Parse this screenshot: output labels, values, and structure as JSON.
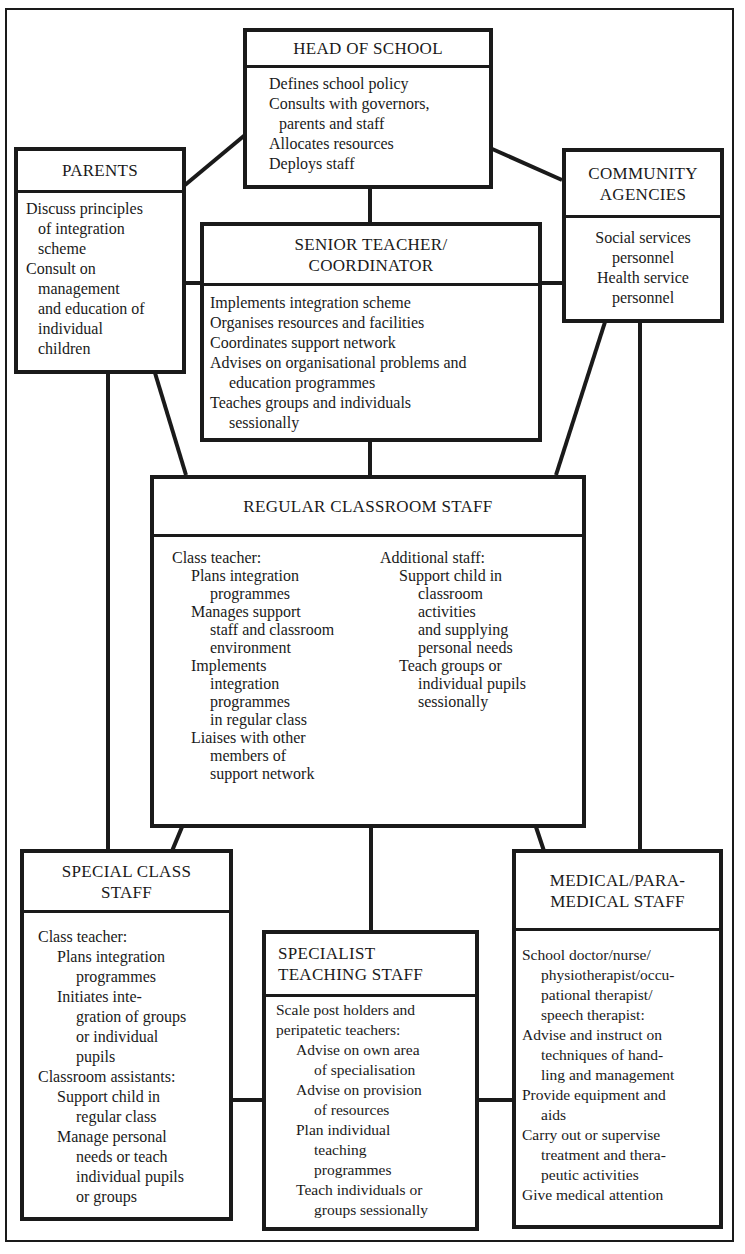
{
  "diagram": {
    "type": "organisational support network",
    "line_color": "#1a1a1a",
    "background": "#ffffff"
  },
  "head": {
    "title": "HEAD OF SCHOOL",
    "lines": [
      {
        "text": "Defines school policy",
        "indent": 0
      },
      {
        "text": "Consults with governors,",
        "indent": 0
      },
      {
        "text": "parents and staff",
        "indent": 1
      },
      {
        "text": "Allocates resources",
        "indent": 0
      },
      {
        "text": "Deploys staff",
        "indent": 0
      }
    ]
  },
  "parents": {
    "title": "PARENTS",
    "lines": [
      {
        "text": "Discuss principles",
        "indent": 0
      },
      {
        "text": "of integration",
        "indent": 1
      },
      {
        "text": "scheme",
        "indent": 1
      },
      {
        "text": "Consult on",
        "indent": 0
      },
      {
        "text": "management",
        "indent": 1
      },
      {
        "text": "and education of",
        "indent": 1
      },
      {
        "text": "individual",
        "indent": 1
      },
      {
        "text": "children",
        "indent": 1
      }
    ]
  },
  "community": {
    "title": "COMMUNITY\nAGENCIES",
    "lines": [
      {
        "text": "Social services",
        "indent": 0
      },
      {
        "text": "personnel",
        "indent": 0
      },
      {
        "text": "Health service",
        "indent": 0
      },
      {
        "text": "personnel",
        "indent": 0
      }
    ]
  },
  "senior": {
    "title": "SENIOR TEACHER/\nCOORDINATOR",
    "lines": [
      {
        "text": "Implements integration scheme",
        "indent": 0
      },
      {
        "text": "Organises resources and facilities",
        "indent": 0
      },
      {
        "text": "Coordinates support network",
        "indent": 0
      },
      {
        "text": "Advises on organisational problems and",
        "indent": 0
      },
      {
        "text": "education programmes",
        "indent": 1
      },
      {
        "text": "Teaches groups and individuals",
        "indent": 0
      },
      {
        "text": "sessionally",
        "indent": 1
      }
    ]
  },
  "regular": {
    "title": "REGULAR CLASSROOM STAFF",
    "left": [
      {
        "text": "Class teacher:",
        "indent": 0
      },
      {
        "text": "Plans integration",
        "indent": 1
      },
      {
        "text": "programmes",
        "indent": 2
      },
      {
        "text": "Manages support",
        "indent": 1
      },
      {
        "text": "staff and classroom",
        "indent": 2
      },
      {
        "text": "environment",
        "indent": 2
      },
      {
        "text": "Implements",
        "indent": 1
      },
      {
        "text": "integration",
        "indent": 2
      },
      {
        "text": "programmes",
        "indent": 2
      },
      {
        "text": "in regular class",
        "indent": 2
      },
      {
        "text": "Liaises with other",
        "indent": 1
      },
      {
        "text": "members of",
        "indent": 2
      },
      {
        "text": "support network",
        "indent": 2
      }
    ],
    "right": [
      {
        "text": "Additional staff:",
        "indent": 0
      },
      {
        "text": "Support child in",
        "indent": 1
      },
      {
        "text": "classroom",
        "indent": 2
      },
      {
        "text": "activities",
        "indent": 2
      },
      {
        "text": "and supplying",
        "indent": 2
      },
      {
        "text": "personal needs",
        "indent": 2
      },
      {
        "text": "Teach groups or",
        "indent": 1
      },
      {
        "text": "individual pupils",
        "indent": 2
      },
      {
        "text": "sessionally",
        "indent": 2
      }
    ]
  },
  "special": {
    "title": "SPECIAL CLASS\nSTAFF",
    "lines": [
      {
        "text": "Class teacher:",
        "indent": 0
      },
      {
        "text": "Plans integration",
        "indent": 1
      },
      {
        "text": "programmes",
        "indent": 2
      },
      {
        "text": "Initiates inte-",
        "indent": 1
      },
      {
        "text": "gration of groups",
        "indent": 2
      },
      {
        "text": "or individual",
        "indent": 2
      },
      {
        "text": "pupils",
        "indent": 2
      },
      {
        "text": "Classroom assistants:",
        "indent": 0
      },
      {
        "text": "Support child in",
        "indent": 1
      },
      {
        "text": "regular class",
        "indent": 2
      },
      {
        "text": "Manage personal",
        "indent": 1
      },
      {
        "text": "needs or teach",
        "indent": 2
      },
      {
        "text": "individual pupils",
        "indent": 2
      },
      {
        "text": "or groups",
        "indent": 2
      }
    ]
  },
  "specialist": {
    "title": "SPECIALIST\nTEACHING STAFF",
    "lines": [
      {
        "text": "Scale post holders and",
        "indent": 0
      },
      {
        "text": "peripatetic teachers:",
        "indent": 0
      },
      {
        "text": "Advise on own area",
        "indent": 1
      },
      {
        "text": "of specialisation",
        "indent": 2
      },
      {
        "text": "Advise on provision",
        "indent": 1
      },
      {
        "text": "of resources",
        "indent": 2
      },
      {
        "text": "Plan individual",
        "indent": 1
      },
      {
        "text": "teaching",
        "indent": 2
      },
      {
        "text": "programmes",
        "indent": 2
      },
      {
        "text": "Teach individuals or",
        "indent": 1
      },
      {
        "text": "groups sessionally",
        "indent": 2
      }
    ]
  },
  "medical": {
    "title": "MEDICAL/PARA-\nMEDICAL STAFF",
    "lines": [
      {
        "text": "School doctor/nurse/",
        "indent": 0
      },
      {
        "text": "physiotherapist/occu-",
        "indent": 1
      },
      {
        "text": "pational therapist/",
        "indent": 1
      },
      {
        "text": "speech therapist:",
        "indent": 1
      },
      {
        "text": "Advise and instruct on",
        "indent": 0
      },
      {
        "text": "techniques of hand-",
        "indent": 1
      },
      {
        "text": "ling and management",
        "indent": 1
      },
      {
        "text": "Provide equipment and",
        "indent": 0
      },
      {
        "text": "aids",
        "indent": 1
      },
      {
        "text": "Carry out or supervise",
        "indent": 0
      },
      {
        "text": "treatment and thera-",
        "indent": 1
      },
      {
        "text": "peutic activities",
        "indent": 1
      },
      {
        "text": "Give medical attention",
        "indent": 0
      }
    ]
  }
}
